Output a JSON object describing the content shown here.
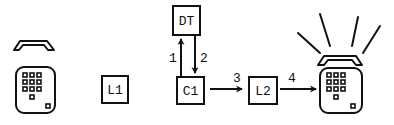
{
  "diagram": {
    "nodes": [
      {
        "id": "caller-phone",
        "label": "",
        "kind": "telephone",
        "state": "idle"
      },
      {
        "id": "L1",
        "label": "L1",
        "kind": "box"
      },
      {
        "id": "DT",
        "label": "DT",
        "kind": "box"
      },
      {
        "id": "C1",
        "label": "C1",
        "kind": "box"
      },
      {
        "id": "L2",
        "label": "L2",
        "kind": "box"
      },
      {
        "id": "callee-phone",
        "label": "",
        "kind": "telephone",
        "state": "ringing"
      }
    ],
    "edges": [
      {
        "from": "C1",
        "to": "DT",
        "label": "1"
      },
      {
        "from": "DT",
        "to": "C1",
        "label": "2"
      },
      {
        "from": "C1",
        "to": "L2",
        "label": "3"
      },
      {
        "from": "L2",
        "to": "callee-phone",
        "label": "4"
      }
    ],
    "colors": {
      "stroke": "#111111",
      "background": "#ffffff"
    }
  }
}
